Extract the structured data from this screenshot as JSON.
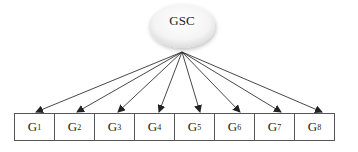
{
  "diagram": {
    "type": "one-factor measurement model",
    "root": {
      "label": "GSC",
      "shape": "ellipse"
    },
    "indicators": [
      {
        "base": "G",
        "sub": "1"
      },
      {
        "base": "G",
        "sub": "2"
      },
      {
        "base": "G",
        "sub": "3"
      },
      {
        "base": "G",
        "sub": "4"
      },
      {
        "base": "G",
        "sub": "5"
      },
      {
        "base": "G",
        "sub": "6"
      },
      {
        "base": "G",
        "sub": "7"
      },
      {
        "base": "G",
        "sub": "8"
      }
    ],
    "edges": [
      {
        "from": "GSC",
        "to": "G1"
      },
      {
        "from": "GSC",
        "to": "G2"
      },
      {
        "from": "GSC",
        "to": "G3"
      },
      {
        "from": "GSC",
        "to": "G4"
      },
      {
        "from": "GSC",
        "to": "G5"
      },
      {
        "from": "GSC",
        "to": "G6"
      },
      {
        "from": "GSC",
        "to": "G7"
      },
      {
        "from": "GSC",
        "to": "G8"
      }
    ],
    "colors": {
      "line": "#333333",
      "box_border": "#555555",
      "ellipse_fill": "#f3f3f3"
    }
  }
}
